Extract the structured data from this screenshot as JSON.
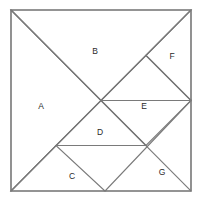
{
  "figure": {
    "kind": "tangram-dissection-diagram",
    "stroke_color": "#7a7a7a",
    "fill_color": "#ffffff",
    "label_color": "#2a2a2a",
    "canvas": {
      "width": 203,
      "height": 205
    },
    "square": {
      "left": 11,
      "top": 10,
      "right": 191,
      "bottom": 191,
      "size": 180
    }
  },
  "pieces": [
    {
      "id": "A",
      "label": "A",
      "shape": "large right triangle",
      "label_pos": {
        "x": 41,
        "y": 106
      },
      "points": "11,10 11,191 101,100.5"
    },
    {
      "id": "B",
      "label": "B",
      "shape": "large right triangle",
      "label_pos": {
        "x": 95,
        "y": 51
      },
      "points": "11,10 191,10 101,100.5"
    },
    {
      "id": "C",
      "label": "C",
      "shape": "medium right triangle",
      "label_pos": {
        "x": 72,
        "y": 176
      },
      "points": "11,191 105,191 56,145.5"
    },
    {
      "id": "D",
      "label": "D",
      "shape": "small right triangle",
      "label_pos": {
        "x": 100,
        "y": 132
      },
      "points": "56,145.5 146,145.5 101,100.5"
    },
    {
      "id": "E",
      "label": "E",
      "shape": "square",
      "label_pos": {
        "x": 144,
        "y": 106
      },
      "points": "101,100.5 146,55.5 191,100.5 146,145.5"
    },
    {
      "id": "F",
      "label": "F",
      "shape": "small right triangle",
      "label_pos": {
        "x": 172,
        "y": 56
      },
      "points": "146,55.5 191,10 191,100.5"
    },
    {
      "id": "G",
      "label": "G",
      "shape": "large right triangle",
      "label_pos": {
        "x": 162,
        "y": 172
      },
      "points": "105,191 191,191 191,100.5"
    }
  ],
  "edges": [
    {
      "name": "outer-square",
      "d": "M11,10 L191,10 L191,191 L11,191 Z"
    },
    {
      "name": "diagonal-topleft-to-bottomright",
      "d": "M11,10 L191,191"
    },
    {
      "name": "diagonal-bottomleft-to-topright",
      "d": "M11,191 L191,10"
    },
    {
      "name": "cut-center-to-right-edge",
      "d": "M101,100.5 L191,100.5"
    },
    {
      "name": "cut-horizontal-D-base",
      "d": "M56,145.5 L146,145.5"
    },
    {
      "name": "cut-F-hypotenuse",
      "d": "M146,55.5 L191,100.5"
    }
  ]
}
